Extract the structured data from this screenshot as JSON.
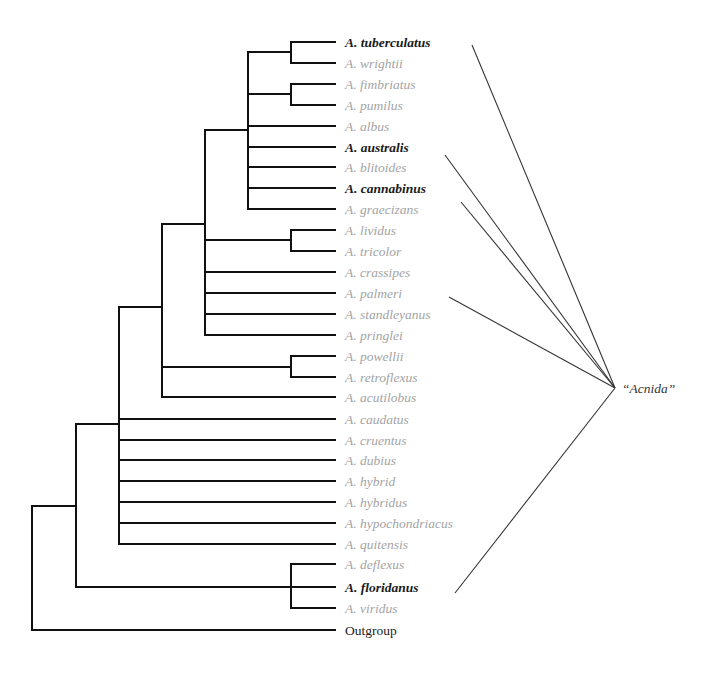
{
  "tree": {
    "taxa": [
      {
        "name": "A. tuberculatus",
        "highlight": true
      },
      {
        "name": "A. wrightii",
        "highlight": false
      },
      {
        "name": "A. fimbriatus",
        "highlight": false
      },
      {
        "name": "A. pumilus",
        "highlight": false
      },
      {
        "name": "A. albus",
        "highlight": false
      },
      {
        "name": "A. australis",
        "highlight": true
      },
      {
        "name": "A. blitoides",
        "highlight": false
      },
      {
        "name": "A. cannabinus",
        "highlight": true
      },
      {
        "name": "A. graecizans",
        "highlight": false
      },
      {
        "name": "A. lividus",
        "highlight": false
      },
      {
        "name": "A. tricolor",
        "highlight": false
      },
      {
        "name": "A. crassipes",
        "highlight": false
      },
      {
        "name": "A. palmeri",
        "highlight": false
      },
      {
        "name": "A. standleyanus",
        "highlight": false
      },
      {
        "name": "A. pringlei",
        "highlight": false
      },
      {
        "name": "A. powellii",
        "highlight": false
      },
      {
        "name": "A. retroflexus",
        "highlight": false
      },
      {
        "name": "A. acutilobus",
        "highlight": false
      },
      {
        "name": "A. caudatus",
        "highlight": false
      },
      {
        "name": "A. cruentus",
        "highlight": false
      },
      {
        "name": "A. dubius",
        "highlight": false
      },
      {
        "name": "A. hybrid",
        "highlight": false
      },
      {
        "name": "A. hybridus",
        "highlight": false
      },
      {
        "name": "A. hypochondriacus",
        "highlight": false
      },
      {
        "name": "A. quitensis",
        "highlight": false
      },
      {
        "name": "A. deflexus",
        "highlight": false
      },
      {
        "name": "A. floridanus",
        "highlight": true
      },
      {
        "name": "A. viridus",
        "highlight": false
      },
      {
        "name": "Outgroup",
        "highlight": false,
        "plain": true
      }
    ],
    "group_label": "“Acnida”",
    "group_members": [
      "A. tuberculatus",
      "A. australis",
      "A. cannabinus",
      "A. palmeri",
      "A. floridanus"
    ],
    "colors": {
      "branch": "#111111",
      "highlight_text": "#1a1a1a",
      "normal_text": "#a3a3a3",
      "pointer": "#333333"
    }
  }
}
